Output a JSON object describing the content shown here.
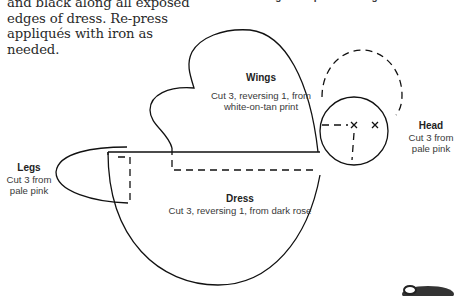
{
  "instructions": {
    "line1": "and black along all exposed",
    "line2": "edges of dress. Re-press",
    "line3": "appliqués with iron as needed."
  },
  "top_caption": "Angel Sampler Lettering",
  "pieces": {
    "wings": {
      "title": "Wings",
      "line1": "Cut 3, reversing 1, from",
      "line2": "white-on-tan print"
    },
    "head": {
      "title": "Head",
      "line1": "Cut 3 from",
      "line2": "pale pink"
    },
    "legs": {
      "title": "Legs",
      "line1": "Cut 3 from",
      "line2": "pale pink"
    },
    "dress": {
      "title": "Dress",
      "line1": "Cut 3, reversing 1, from dark rose"
    }
  },
  "colors": {
    "line": "#111111",
    "text": "#333333",
    "background": "#ffffff"
  }
}
